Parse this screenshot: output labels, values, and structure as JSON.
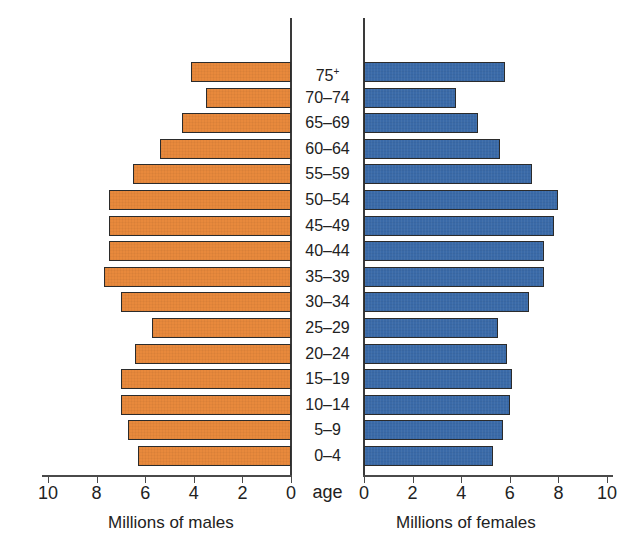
{
  "chart_data": {
    "type": "bar",
    "subtype": "population-pyramid",
    "title": "",
    "xlabel": "",
    "ylabel": "age",
    "grid": false,
    "legend_position": "none",
    "categories": [
      "0–4",
      "5–9",
      "10–14",
      "15–19",
      "20–24",
      "25–29",
      "30–34",
      "35–39",
      "40–44",
      "45–49",
      "50–54",
      "55–59",
      "60–64",
      "65–69",
      "70–74",
      "75+"
    ],
    "series": [
      {
        "name": "Millions of males",
        "color": "#E8893C",
        "side": "left",
        "axis_label": "Millions of males",
        "axis_ticks": [
          10,
          8,
          6,
          4,
          2,
          0
        ],
        "xlim": [
          0,
          10
        ],
        "values": [
          6.3,
          6.7,
          7.0,
          7.0,
          6.4,
          5.7,
          7.0,
          7.7,
          7.5,
          7.5,
          7.5,
          6.5,
          5.4,
          4.5,
          3.5,
          4.1
        ]
      },
      {
        "name": "Millions of females",
        "color": "#3A6AA8",
        "side": "right",
        "axis_label": "Millions of females",
        "axis_ticks": [
          0,
          2,
          4,
          6,
          8,
          10
        ],
        "xlim": [
          0,
          10
        ],
        "values": [
          5.3,
          5.7,
          6.0,
          6.1,
          5.9,
          5.5,
          6.8,
          7.4,
          7.4,
          7.8,
          8.0,
          6.9,
          5.6,
          4.7,
          3.8,
          5.8
        ]
      }
    ]
  },
  "chart": {
    "title_faint": "",
    "age_axis_caption": "age",
    "male_axis_caption": "Millions of males",
    "female_axis_caption": "Millions of females",
    "age_groups": [
      {
        "label": "75+",
        "super": "+",
        "base": "75"
      },
      {
        "label": "70–74"
      },
      {
        "label": "65–69"
      },
      {
        "label": "60–64"
      },
      {
        "label": "55–59"
      },
      {
        "label": "50–54"
      },
      {
        "label": "45–49"
      },
      {
        "label": "40–44"
      },
      {
        "label": "35–39"
      },
      {
        "label": "30–34"
      },
      {
        "label": "25–29"
      },
      {
        "label": "20–24"
      },
      {
        "label": "15–19"
      },
      {
        "label": "10–14"
      },
      {
        "label": "5–9"
      },
      {
        "label": "0–4"
      }
    ],
    "male_ticks": [
      "10",
      "8",
      "6",
      "4",
      "2",
      "0"
    ],
    "female_ticks": [
      "0",
      "2",
      "4",
      "6",
      "8",
      "10"
    ],
    "colors": {
      "male_bar": "#E8893C",
      "female_bar": "#3A6AA8",
      "bar_outline": "#2b2b2b",
      "axis": "#3a3a3a",
      "text": "#222222",
      "background": "#ffffff"
    }
  }
}
